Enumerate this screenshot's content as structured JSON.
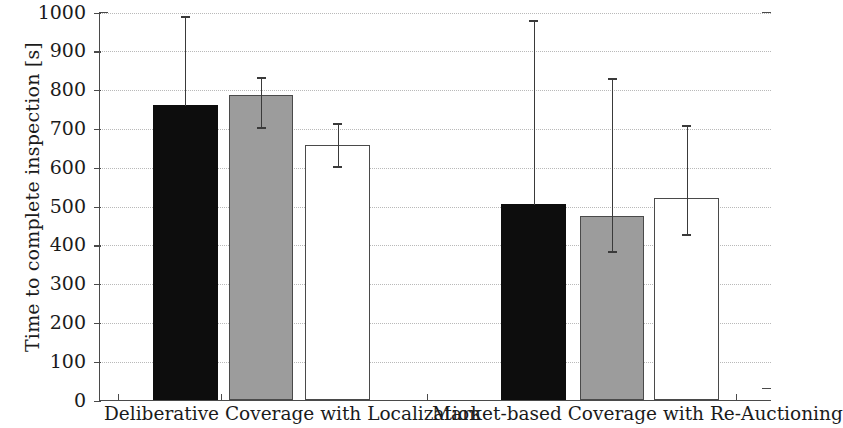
{
  "chart_data": {
    "type": "bar",
    "title": "",
    "xlabel": "",
    "ylabel": "Time to complete inspection [s]",
    "ylim": [
      0,
      1000
    ],
    "ytick_labels": [
      "0",
      "100",
      "200",
      "300",
      "400",
      "500",
      "600",
      "700",
      "800",
      "900",
      "1000"
    ],
    "ytick_values": [
      0,
      100,
      200,
      300,
      400,
      500,
      600,
      700,
      800,
      900,
      1000
    ],
    "grid": "horizontal-dotted",
    "legend": "none",
    "categories": [
      "Deliberative Coverage with Localization",
      "Market-based Coverage with Re-Auctioning"
    ],
    "series": [
      {
        "name": "black",
        "color": "#0d0d0d",
        "values": [
          760,
          505
        ],
        "err_low": [
          760,
          505
        ],
        "err_high": [
          990,
          980
        ]
      },
      {
        "name": "gray",
        "color": "#9c9c9c",
        "values": [
          785,
          473
        ],
        "err_low": [
          705,
          385
        ],
        "err_high": [
          835,
          830
        ]
      },
      {
        "name": "white",
        "color": "#ffffff",
        "values": [
          655,
          520
        ],
        "err_low": [
          605,
          430
        ],
        "err_high": [
          715,
          710
        ]
      }
    ],
    "bars": [
      {
        "group": 0,
        "series": "black",
        "value": 760,
        "err_high": 990,
        "err_low": 760,
        "x_left": 151.7,
        "width": 65
      },
      {
        "group": 0,
        "series": "gray",
        "value": 785,
        "err_high": 835,
        "err_low": 705,
        "x_left": 228.3,
        "width": 63.4
      },
      {
        "group": 0,
        "series": "white",
        "value": 655,
        "err_high": 715,
        "err_low": 605,
        "x_left": 304.3,
        "width": 64.7
      },
      {
        "group": 1,
        "series": "black",
        "value": 505,
        "err_high": 980,
        "err_low": 505,
        "x_left": 500,
        "width": 65
      },
      {
        "group": 1,
        "series": "gray",
        "value": 473,
        "err_high": 830,
        "err_low": 385,
        "x_left": 579.3,
        "width": 63.4
      },
      {
        "group": 1,
        "series": "white",
        "value": 520,
        "err_high": 710,
        "err_low": 430,
        "x_left": 653.3,
        "width": 65
      }
    ],
    "xtick_positions": [
      117,
      220,
      323,
      426,
      529,
      632,
      735
    ]
  },
  "axis": {
    "y_title": "Time to complete inspection [s]",
    "x_group_1": "Deliberative Coverage with Localization",
    "x_group_2": "Market-based Coverage with Re-Auctioning"
  }
}
